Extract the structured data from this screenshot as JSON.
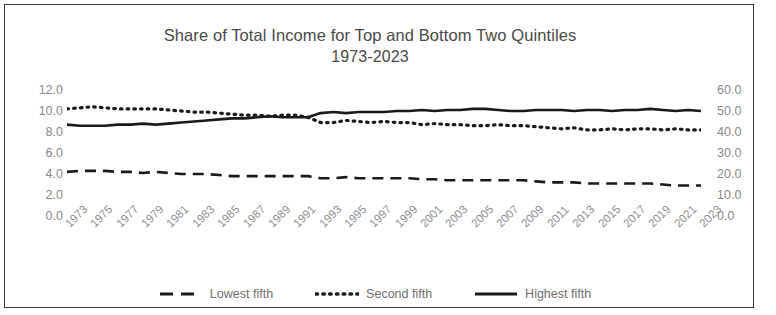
{
  "chart_data": {
    "type": "line",
    "title": "Share of Total Income for Top and Bottom Two Quintiles",
    "subtitle": "1973-2023",
    "xlabel": "",
    "ylabel": "",
    "grid": false,
    "legend_position": "bottom",
    "ylim": [
      0.0,
      12.0
    ],
    "yticks": [
      "12.0",
      "10.0",
      "8.0",
      "6.0",
      "4.0",
      "2.0",
      "0.0"
    ],
    "ylim_right": [
      0.0,
      60.0
    ],
    "yticks_right": [
      "60.0",
      "50.0",
      "40.0",
      "30.0",
      "20.0",
      "10.0",
      "0.0"
    ],
    "x": [
      1973,
      1974,
      1975,
      1976,
      1977,
      1978,
      1979,
      1980,
      1981,
      1982,
      1983,
      1984,
      1985,
      1986,
      1987,
      1988,
      1989,
      1990,
      1991,
      1992,
      1993,
      1994,
      1995,
      1996,
      1997,
      1998,
      1999,
      2000,
      2001,
      2002,
      2003,
      2004,
      2005,
      2006,
      2007,
      2008,
      2009,
      2010,
      2011,
      2012,
      2013,
      2014,
      2015,
      2016,
      2017,
      2018,
      2019,
      2020,
      2021,
      2022,
      2023
    ],
    "xticks": [
      "1973",
      "1975",
      "1977",
      "1979",
      "1981",
      "1983",
      "1985",
      "1987",
      "1989",
      "1991",
      "1993",
      "1995",
      "1997",
      "1999",
      "2001",
      "2003",
      "2005",
      "2007",
      "2009",
      "2011",
      "2013",
      "2015",
      "2017",
      "2019",
      "2021",
      "2023"
    ],
    "series": [
      {
        "name": "Lowest fifth",
        "style": "dashed",
        "axis": "left",
        "color": "#1a1a1a",
        "values": [
          4.2,
          4.3,
          4.3,
          4.3,
          4.2,
          4.2,
          4.1,
          4.2,
          4.1,
          4.0,
          4.0,
          4.0,
          3.9,
          3.8,
          3.8,
          3.8,
          3.8,
          3.8,
          3.8,
          3.8,
          3.6,
          3.6,
          3.7,
          3.6,
          3.6,
          3.6,
          3.6,
          3.6,
          3.5,
          3.5,
          3.4,
          3.4,
          3.4,
          3.4,
          3.4,
          3.4,
          3.4,
          3.3,
          3.2,
          3.2,
          3.2,
          3.1,
          3.1,
          3.1,
          3.1,
          3.1,
          3.1,
          3.0,
          2.9,
          2.9,
          2.9
        ]
      },
      {
        "name": "Second fifth",
        "style": "dotted",
        "axis": "left",
        "color": "#1a1a1a",
        "values": [
          10.2,
          10.3,
          10.4,
          10.3,
          10.2,
          10.2,
          10.2,
          10.2,
          10.1,
          10.0,
          9.9,
          9.9,
          9.8,
          9.7,
          9.6,
          9.6,
          9.5,
          9.6,
          9.6,
          9.4,
          8.9,
          8.9,
          9.1,
          9.0,
          8.9,
          9.0,
          8.9,
          8.9,
          8.7,
          8.8,
          8.7,
          8.7,
          8.6,
          8.6,
          8.7,
          8.6,
          8.6,
          8.5,
          8.4,
          8.3,
          8.4,
          8.2,
          8.2,
          8.3,
          8.2,
          8.3,
          8.3,
          8.2,
          8.3,
          8.2,
          8.2
        ]
      },
      {
        "name": "Highest fifth",
        "style": "solid",
        "axis": "left",
        "color": "#1a1a1a",
        "values": [
          8.7,
          8.6,
          8.6,
          8.6,
          8.7,
          8.7,
          8.8,
          8.7,
          8.8,
          8.9,
          9.0,
          9.1,
          9.2,
          9.3,
          9.3,
          9.4,
          9.5,
          9.4,
          9.4,
          9.4,
          9.8,
          9.9,
          9.8,
          9.9,
          9.9,
          9.9,
          10.0,
          10.0,
          10.1,
          10.0,
          10.1,
          10.1,
          10.2,
          10.2,
          10.1,
          10.0,
          10.0,
          10.1,
          10.1,
          10.1,
          10.0,
          10.1,
          10.1,
          10.0,
          10.1,
          10.1,
          10.2,
          10.1,
          10.0,
          10.1,
          10.0
        ]
      }
    ],
    "legend": [
      "Lowest fifth",
      "Second fifth",
      "Highest fifth"
    ]
  }
}
